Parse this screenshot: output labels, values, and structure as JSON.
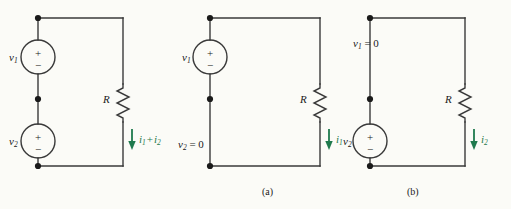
{
  "figure": {
    "background_color": "#fbfbf7",
    "wire_color": "#3a3a3a",
    "current_color": "#1f7a4d"
  },
  "circuits": [
    {
      "id": "full",
      "caption": "",
      "sources": [
        {
          "name": "v1-source",
          "label_v": "v",
          "label_sub": "1",
          "plus": "+",
          "minus": "−"
        },
        {
          "name": "v2-source",
          "label_v": "v",
          "label_sub": "2",
          "plus": "+",
          "minus": "−"
        }
      ],
      "resistor": {
        "label": "R"
      },
      "current": {
        "label_i": "i",
        "label_sub": "1",
        "operator": "+",
        "label_i2": "i",
        "label_sub2": "2",
        "direction": "down"
      }
    },
    {
      "id": "a",
      "caption": "(a)",
      "sources": [
        {
          "name": "v1-source",
          "label_v": "v",
          "label_sub": "1",
          "plus": "+",
          "minus": "−"
        }
      ],
      "shorted": {
        "label_v": "v",
        "label_sub": "2",
        "equals": " = 0"
      },
      "resistor": {
        "label": "R"
      },
      "current": {
        "label_i": "i",
        "label_sub": "1",
        "direction": "down"
      }
    },
    {
      "id": "b",
      "caption": "(b)",
      "sources": [
        {
          "name": "v2-source",
          "label_v": "v",
          "label_sub": "2",
          "plus": "+",
          "minus": "−"
        }
      ],
      "shorted": {
        "label_v": "v",
        "label_sub": "1",
        "equals": " = 0"
      },
      "resistor": {
        "label": "R"
      },
      "current": {
        "label_i": "i",
        "label_sub": "2",
        "direction": "down"
      }
    }
  ]
}
